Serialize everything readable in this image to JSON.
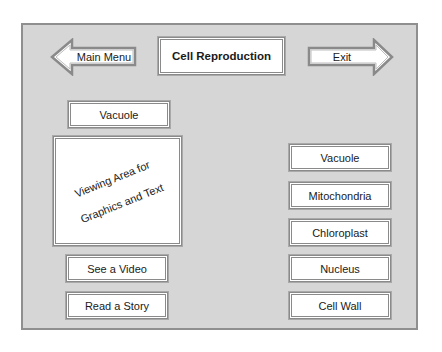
{
  "header": {
    "title": "Cell Reproduction",
    "back_button": {
      "label": "Main Menu",
      "icon": "arrow-left-icon"
    },
    "exit_button": {
      "label": "Exit",
      "icon": "arrow-right-icon"
    }
  },
  "left_panel": {
    "selected_label": "Vacuole",
    "viewing_area": {
      "line1": "Viewing Area for",
      "line2": "Graphics and Text"
    },
    "buttons": [
      {
        "label": "See a Video"
      },
      {
        "label": "Read a Story"
      }
    ]
  },
  "right_panel": {
    "items": [
      {
        "label": "Vacuole"
      },
      {
        "label": "Mitochondria"
      },
      {
        "label": "Chloroplast"
      },
      {
        "label": "Nucleus"
      },
      {
        "label": "Cell Wall"
      }
    ]
  },
  "colors": {
    "frame_background": "#d6d6d6",
    "frame_border": "#8f8f8f",
    "box_background": "#ffffff",
    "box_border": "#8a8a8a"
  }
}
